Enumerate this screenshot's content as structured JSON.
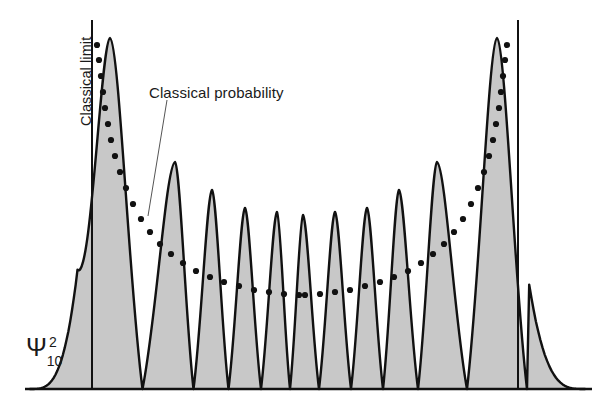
{
  "figure": {
    "type": "quantum-harmonic-oscillator-probability-density",
    "state_label_base": "Ψ",
    "state_label_superscript": "2",
    "state_label_subscript": "10",
    "classical_limit_label": "Classical limit",
    "classical_probability_label": "Classical probability",
    "colors": {
      "curve_stroke": "#111111",
      "fill": "#c8c8c8",
      "dots": "#111111",
      "axis": "#111111",
      "limit_line": "#111111",
      "leader_line": "#555555",
      "background": "#ffffff"
    }
  },
  "chart_data": {
    "type": "line",
    "title": "",
    "xlabel": "",
    "ylabel": "Ψ²₁₀",
    "quantum_number_n": 10,
    "peak_count": 11,
    "node_count": 10,
    "grid": false,
    "legend": "none",
    "axis": {
      "baseline_y_px": 389,
      "x_start_px": 25,
      "x_end_px": 592,
      "y_top_px": 20
    },
    "classical_limits": {
      "left_x_px": 92,
      "right_x_px": 518,
      "y_top_px": 20,
      "y_bottom_px": 389
    },
    "psi_squared_peaks": [
      {
        "index": 1,
        "x_px": 110,
        "apex_y_px": 38
      },
      {
        "index": 2,
        "x_px": 175,
        "apex_y_px": 162
      },
      {
        "index": 3,
        "x_px": 212,
        "apex_y_px": 190
      },
      {
        "index": 4,
        "x_px": 245,
        "apex_y_px": 208
      },
      {
        "index": 5,
        "x_px": 277,
        "apex_y_px": 212
      },
      {
        "index": 6,
        "x_px": 303,
        "apex_y_px": 215
      },
      {
        "index": 7,
        "x_px": 335,
        "apex_y_px": 212
      },
      {
        "index": 8,
        "x_px": 367,
        "apex_y_px": 208
      },
      {
        "index": 9,
        "x_px": 399,
        "apex_y_px": 190
      },
      {
        "index": 10,
        "x_px": 437,
        "apex_y_px": 162
      },
      {
        "index": 11,
        "x_px": 497,
        "apex_y_px": 38
      }
    ],
    "classical_probability_curve": {
      "description": "U-shaped classical probability density, drawn as dots, diverging at the turning points",
      "style": "dotted",
      "points_px": [
        [
          97,
          45
        ],
        [
          99,
          60
        ],
        [
          101,
          76
        ],
        [
          103,
          92
        ],
        [
          105,
          108
        ],
        [
          108,
          124
        ],
        [
          111,
          140
        ],
        [
          115,
          156
        ],
        [
          120,
          172
        ],
        [
          126,
          188
        ],
        [
          133,
          204
        ],
        [
          141,
          219
        ],
        [
          150,
          232
        ],
        [
          160,
          244
        ],
        [
          171,
          254
        ],
        [
          183,
          263
        ],
        [
          196,
          271
        ],
        [
          210,
          277
        ],
        [
          224,
          282
        ],
        [
          239,
          286
        ],
        [
          254,
          290
        ],
        [
          269,
          292
        ],
        [
          284,
          294
        ],
        [
          299,
          295
        ],
        [
          305,
          295
        ],
        [
          320,
          294
        ],
        [
          335,
          292
        ],
        [
          350,
          290
        ],
        [
          365,
          286
        ],
        [
          380,
          282
        ],
        [
          394,
          277
        ],
        [
          408,
          271
        ],
        [
          421,
          263
        ],
        [
          433,
          254
        ],
        [
          444,
          244
        ],
        [
          454,
          232
        ],
        [
          463,
          219
        ],
        [
          471,
          204
        ],
        [
          478,
          188
        ],
        [
          484,
          172
        ],
        [
          489,
          156
        ],
        [
          493,
          140
        ],
        [
          496,
          124
        ],
        [
          499,
          108
        ],
        [
          501,
          92
        ],
        [
          503,
          76
        ],
        [
          505,
          60
        ],
        [
          507,
          45
        ]
      ]
    },
    "leader_line": {
      "from_px": [
        167,
        100
      ],
      "to_px": [
        148,
        216
      ]
    },
    "labels": [
      {
        "text": "Classical limit",
        "x_px": 78,
        "y_px": 20,
        "rotation_deg": -90
      },
      {
        "text": "Classical probability",
        "x_px": 149,
        "y_px": 84,
        "rotation_deg": 0
      },
      {
        "text": "Ψ²₁₀",
        "x_px": 26,
        "y_px": 333,
        "rotation_deg": 0
      }
    ]
  }
}
